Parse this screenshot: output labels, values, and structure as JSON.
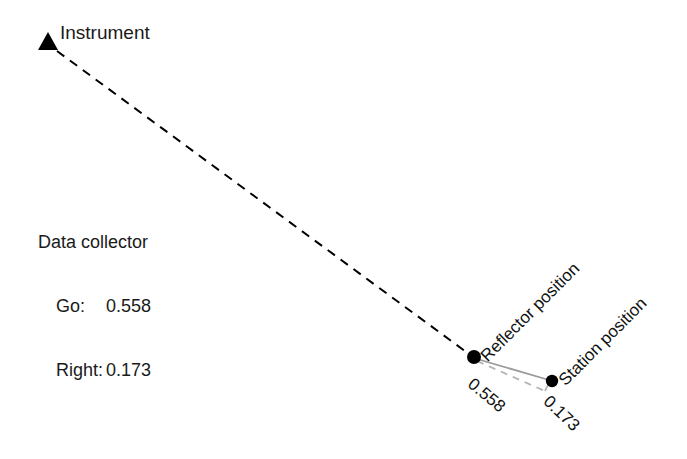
{
  "diagram": {
    "background_color": "#ffffff",
    "width": 687,
    "height": 459
  },
  "instrument": {
    "label": "Instrument",
    "marker": "triangle-marker",
    "marker_color": "#000000",
    "x": 48,
    "y": 42
  },
  "data_collector": {
    "title": "Data collector",
    "go_label": "Go:",
    "go_value": "0.558",
    "right_label": "Right:",
    "right_value": "0.173"
  },
  "points": {
    "reflector": {
      "label": "Reflector position",
      "x": 474,
      "y": 357,
      "dot_color": "#000000",
      "dot_radius": 7
    },
    "station": {
      "label": "Station position",
      "x": 552,
      "y": 381,
      "dot_color": "#000000",
      "dot_radius": 6
    }
  },
  "measurements": {
    "go": "0.558",
    "right": "0.173"
  },
  "lines": {
    "sight_line": {
      "name": "instrument-sight-line",
      "style": "dashed",
      "color": "#000000",
      "from_x": 56,
      "from_y": 50,
      "to_x": 470,
      "to_y": 355
    },
    "direct_line": {
      "name": "reflector-station-line",
      "style": "solid",
      "color": "#9a9a9a"
    },
    "go_leg": {
      "name": "go-offset-leg",
      "style": "dashed",
      "color": "#b0b0b0"
    },
    "right_leg": {
      "name": "right-offset-leg",
      "style": "dashed",
      "color": "#b0b0b0"
    }
  }
}
